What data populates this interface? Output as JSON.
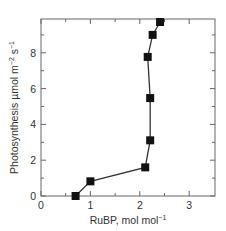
{
  "chart_data": {
    "type": "line",
    "title": "",
    "xlabel": "RuBP, mol mol⁻¹",
    "xlabel_parts": {
      "main": "RuBP, mol mol",
      "sup": "−1"
    },
    "ylabel": "Photosynthesis µmol m⁻² s⁻¹",
    "ylabel_parts": {
      "main": "Photosynthesis µmol m",
      "sup1": "−2",
      "mid": " s",
      "sup2": "−1"
    },
    "xlim": [
      0,
      3.5
    ],
    "ylim": [
      0,
      9.9
    ],
    "xticks": [
      0,
      1,
      2,
      3
    ],
    "xticks_minor": [
      0.5,
      1.5,
      2.5
    ],
    "yticks": [
      0,
      2,
      4,
      6,
      8
    ],
    "yticks_minor": [
      1,
      3,
      5,
      7,
      9
    ],
    "grid": false,
    "legend": null,
    "series": [
      {
        "name": "Photosynthesis vs RuBP",
        "marker": "square",
        "color": "#111111",
        "x": [
          0.7,
          1.0,
          2.11,
          2.21,
          2.21,
          2.16,
          2.26,
          2.41
        ],
        "y": [
          0.0,
          0.82,
          1.6,
          3.11,
          5.47,
          7.77,
          9.0,
          9.72
        ]
      }
    ]
  }
}
